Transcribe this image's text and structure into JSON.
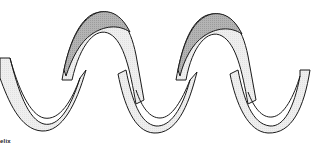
{
  "figure": {
    "caption": "elix",
    "colors": {
      "outline": "#1a1a1a",
      "ribbon_light": "#ececec",
      "ribbon_dark": "#b4b4b4",
      "background": "#ffffff"
    }
  }
}
